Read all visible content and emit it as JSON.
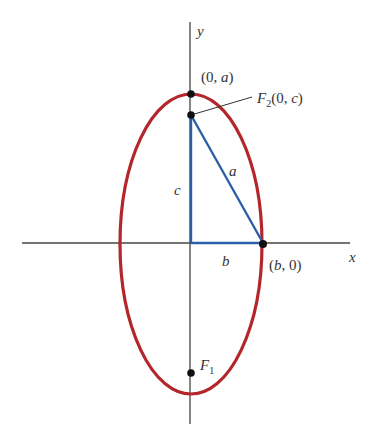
{
  "diagram": {
    "type": "ellipse-foci",
    "colors": {
      "ellipse": "#b3262b",
      "triangle": "#2a5fa8",
      "axes": "#444444",
      "points": "#111111",
      "text": "#333333"
    },
    "axes": {
      "x_label": "x",
      "y_label": "y"
    },
    "labels": {
      "vertex_top": {
        "open": "(0, ",
        "var": "a",
        "close": ")"
      },
      "focus_top": {
        "name": "F",
        "sub": "2",
        "open": "(0, ",
        "var": "c",
        "close": ")"
      },
      "focus_bottom": {
        "name": "F",
        "sub": "1"
      },
      "vertex_right": {
        "open": "(",
        "var": "b",
        "close": ", 0)"
      },
      "side_hypotenuse": "a",
      "side_vertical": "c",
      "side_horizontal": "b"
    }
  }
}
